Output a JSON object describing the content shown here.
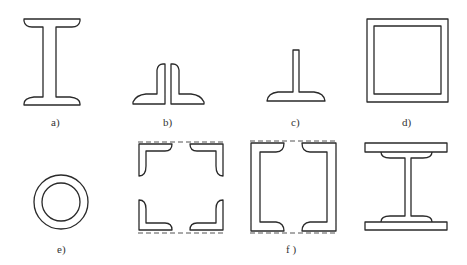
{
  "figure": {
    "stroke_color": "#2a2a2a",
    "background": "#ffffff",
    "panels": [
      {
        "id": "a",
        "label": "a)",
        "shape": "rolled I-beam section"
      },
      {
        "id": "b",
        "label": "b)",
        "shape": "double angle section (back to back)"
      },
      {
        "id": "c",
        "label": "c)",
        "shape": "T section"
      },
      {
        "id": "d",
        "label": "d)",
        "shape": "square hollow box section"
      },
      {
        "id": "e",
        "label": "e)",
        "shape": "circular tube section"
      },
      {
        "id": "f",
        "label": "f )",
        "shape": "built-up lattice sections: four angles, two channels, plated I-beam"
      }
    ]
  }
}
